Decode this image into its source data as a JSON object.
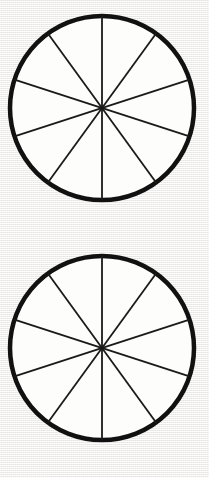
{
  "page": {
    "background_color": "#f2f1ef",
    "width": 209,
    "height": 478
  },
  "figures": [
    {
      "name": "fraction-circle-1",
      "label": "Circle divided into 10 equal sectors",
      "center_x": 102,
      "center_y": 108,
      "radius": 92,
      "rim_color": "#111111",
      "rim_width": 4.5,
      "spoke_color": "#1a1a1a",
      "spoke_width": 1.8,
      "fill_color": "#fdfdfc",
      "sector_count": 10,
      "sector_angle_degrees": 36,
      "diameter_count": 5,
      "diameter_angles_degrees": [
        90,
        54,
        18,
        342,
        306
      ]
    },
    {
      "name": "fraction-circle-2",
      "label": "Circle divided into 10 equal sectors",
      "center_x": 102,
      "center_y": 108,
      "radius": 92,
      "rim_color": "#111111",
      "rim_width": 4.5,
      "spoke_color": "#1a1a1a",
      "spoke_width": 1.8,
      "fill_color": "#fdfdfc",
      "sector_count": 10,
      "sector_angle_degrees": 36,
      "diameter_count": 5,
      "diameter_angles_degrees": [
        90,
        54,
        18,
        342,
        306
      ]
    }
  ]
}
